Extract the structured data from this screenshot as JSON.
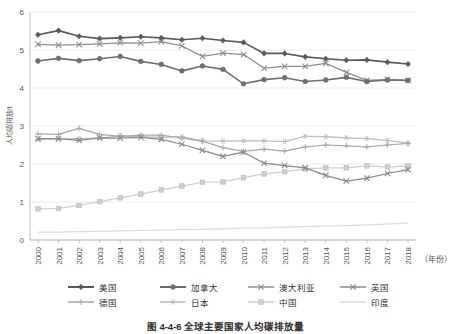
{
  "figure": {
    "caption": "图 4-4-6  全球主要国家人均碳排放量",
    "x_axis_name": "（年份）",
    "y_axis_name": "人均碳排放/t"
  },
  "chart_data": {
    "type": "line",
    "title": "图 4-4-6  全球主要国家人均碳排放量",
    "xlabel": "（年份）",
    "ylabel": "人均碳排放/t",
    "ylim": [
      0,
      6
    ],
    "yticks": [
      0,
      1,
      2,
      3,
      4,
      5,
      6
    ],
    "grid": true,
    "legend_position": "bottom",
    "categories": [
      "2000",
      "2001",
      "2002",
      "2003",
      "2004",
      "2005",
      "2006",
      "2007",
      "2008",
      "2009",
      "2010",
      "2011",
      "2012",
      "2013",
      "2014",
      "2015",
      "2016",
      "2017",
      "2018"
    ],
    "series": [
      {
        "name": "美国",
        "color": "#595959",
        "marker": "diamond",
        "values": [
          5.4,
          5.51,
          5.36,
          5.3,
          5.32,
          5.35,
          5.32,
          5.27,
          5.31,
          5.25,
          5.2,
          4.91,
          4.91,
          4.82,
          4.77,
          4.73,
          4.74,
          4.68,
          4.63
        ]
      },
      {
        "name": "加拿大",
        "color": "#6e6e6e",
        "marker": "circle",
        "values": [
          4.71,
          4.78,
          4.72,
          4.77,
          4.83,
          4.7,
          4.62,
          4.45,
          4.58,
          4.49,
          4.11,
          4.22,
          4.27,
          4.17,
          4.21,
          4.28,
          4.17,
          4.21,
          4.2
        ]
      },
      {
        "name": "澳大利亚",
        "color": "#8f8f8f",
        "marker": "x",
        "values": [
          5.15,
          5.13,
          5.14,
          5.16,
          5.19,
          5.18,
          5.22,
          5.11,
          4.83,
          4.92,
          4.88,
          4.52,
          4.57,
          4.57,
          4.65,
          4.41,
          4.2,
          4.23,
          4.2
        ]
      },
      {
        "name": "英国",
        "color": "#8a8a8a",
        "marker": "x",
        "values": [
          2.67,
          2.67,
          2.62,
          2.69,
          2.68,
          2.7,
          2.65,
          2.52,
          2.36,
          2.2,
          2.31,
          2.02,
          1.96,
          1.9,
          1.7,
          1.55,
          1.63,
          1.75,
          1.85
        ]
      },
      {
        "name": "德国",
        "color": "#a8a8a8",
        "marker": "plus",
        "values": [
          2.79,
          2.78,
          2.94,
          2.78,
          2.73,
          2.76,
          2.76,
          2.68,
          2.6,
          2.43,
          2.33,
          2.39,
          2.34,
          2.45,
          2.5,
          2.48,
          2.45,
          2.5,
          2.54
        ]
      },
      {
        "name": "日本",
        "color": "#bdbdbd",
        "marker": "star",
        "values": [
          2.64,
          2.66,
          2.67,
          2.68,
          2.74,
          2.72,
          2.7,
          2.72,
          2.61,
          2.6,
          2.61,
          2.61,
          2.59,
          2.73,
          2.72,
          2.69,
          2.67,
          2.62,
          2.55
        ]
      },
      {
        "name": "中国",
        "color": "#cfcfcf",
        "marker": "square",
        "values": [
          0.82,
          0.83,
          0.91,
          1.01,
          1.11,
          1.21,
          1.32,
          1.42,
          1.52,
          1.53,
          1.64,
          1.74,
          1.8,
          1.87,
          1.9,
          1.9,
          1.95,
          1.92,
          1.95
        ]
      },
      {
        "name": "印度",
        "color": "#dcdcdc",
        "marker": "none",
        "values": [
          0.21,
          0.21,
          0.22,
          0.23,
          0.24,
          0.25,
          0.26,
          0.27,
          0.28,
          0.29,
          0.31,
          0.32,
          0.34,
          0.35,
          0.37,
          0.38,
          0.4,
          0.42,
          0.45
        ]
      }
    ]
  },
  "legend": {
    "row1": [
      "美国",
      "加拿大",
      "澳大利亚",
      "英国"
    ],
    "row2": [
      "德国",
      "日本",
      "中国",
      "印度"
    ]
  }
}
